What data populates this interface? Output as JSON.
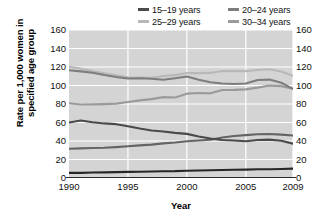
{
  "chart_data": {
    "type": "line",
    "title": "",
    "xlabel": "Year",
    "ylabel": "Rate per 1,000 women in specified age group",
    "ylabel_line1": "Rate per 1,000 women in",
    "ylabel_line2": "specified age group",
    "xlim": [
      1990,
      2009
    ],
    "ylim": [
      0,
      160
    ],
    "yticks": [
      160,
      140,
      120,
      100,
      80,
      60,
      40,
      20,
      0
    ],
    "xticks": [
      1990,
      1995,
      2000,
      2005,
      2009
    ],
    "xtick_labels": [
      "1990",
      "1995",
      "2000",
      "2005",
      "2009"
    ],
    "ytick_labels_left": [
      "160",
      "140",
      "120",
      "100",
      "80",
      "60",
      "40",
      "20",
      "0"
    ],
    "ytick_labels_right": [
      "160",
      "140",
      "120",
      "100",
      "80",
      "60",
      "40",
      "20",
      "0"
    ],
    "grid": true,
    "grid_color": "#ffffff",
    "plot_background": "#d4d4d4",
    "legend_position": "top-right",
    "x": [
      1990,
      1991,
      1992,
      1993,
      1994,
      1995,
      1996,
      1997,
      1998,
      1999,
      2000,
      2001,
      2002,
      2003,
      2004,
      2005,
      2006,
      2007,
      2008,
      2009
    ],
    "series": [
      {
        "name": "15–19 years",
        "color": "#4a4a4a",
        "values": [
          59.9,
          62.1,
          60.3,
          59.0,
          58.2,
          56.0,
          53.5,
          51.3,
          50.3,
          48.8,
          47.7,
          44.8,
          42.6,
          41.1,
          40.5,
          39.7,
          41.1,
          41.5,
          40.2,
          37.1
        ]
      },
      {
        "name": "20–24 years",
        "color": "#7d7d7d",
        "values": [
          116.5,
          115.3,
          113.7,
          111.3,
          109.2,
          107.5,
          107.8,
          107.3,
          106.2,
          107.9,
          109.7,
          106.2,
          103.6,
          102.1,
          101.7,
          102.2,
          105.9,
          106.4,
          103.0,
          96.3
        ]
      },
      {
        "name": "25–29 years",
        "color": "#b8b8b8",
        "values": [
          120.2,
          118.2,
          115.7,
          113.2,
          111.0,
          108.8,
          108.6,
          108.3,
          110.2,
          111.2,
          113.5,
          113.4,
          113.6,
          115.6,
          115.5,
          115.5,
          116.8,
          117.5,
          115.1,
          110.5
        ]
      },
      {
        "name": "30–34 years",
        "color": "#9a9a9a",
        "values": [
          80.8,
          79.5,
          79.6,
          79.9,
          80.4,
          82.1,
          83.9,
          85.3,
          87.4,
          87.1,
          91.2,
          91.9,
          91.5,
          95.1,
          95.3,
          95.8,
          97.7,
          99.9,
          99.3,
          96.5
        ]
      },
      {
        "name": "35–39 years",
        "color": "#646464",
        "values": [
          31.7,
          32.0,
          32.5,
          32.7,
          33.4,
          34.3,
          35.3,
          36.1,
          37.4,
          38.3,
          39.7,
          40.6,
          41.4,
          43.8,
          45.4,
          46.3,
          47.3,
          47.5,
          46.9,
          45.9
        ]
      },
      {
        "name": "40–44 years",
        "color": "#262626",
        "values": [
          5.5,
          5.5,
          6.0,
          6.1,
          6.4,
          6.6,
          6.8,
          7.1,
          7.3,
          7.4,
          7.9,
          8.1,
          8.3,
          8.7,
          8.9,
          9.1,
          9.4,
          9.5,
          9.8,
          10.1
        ]
      }
    ],
    "legend_entries": [
      {
        "label": "15–19 years",
        "color": "#4a4a4a"
      },
      {
        "label": "20–24 years",
        "color": "#7d7d7d"
      },
      {
        "label": "25–29 years",
        "color": "#b8b8b8"
      },
      {
        "label": "30–34 years",
        "color": "#9a9a9a"
      },
      {
        "label": "35–39 years",
        "color": "#646464"
      },
      {
        "label": "40–44 years",
        "color": "#262626"
      }
    ]
  }
}
